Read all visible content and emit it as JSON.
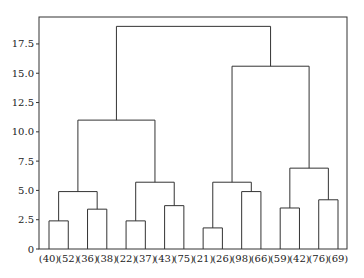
{
  "chart_data": {
    "type": "dendrogram",
    "title": "",
    "xlabel": "",
    "ylabel": "",
    "ylim": [
      0,
      19.8
    ],
    "yticks": [
      "0",
      "2.5",
      "5.0",
      "7.5",
      "10.0",
      "12.5",
      "15.0",
      "17.5"
    ],
    "grid": false,
    "leaves": [
      "(40)",
      "(52)",
      "(36)",
      "(38)",
      "(22)",
      "(37)",
      "(43)",
      "(75)",
      "(21)",
      "(26)",
      "(98)",
      "(66)",
      "(59)",
      "(42)",
      "(76)",
      "(69)"
    ],
    "merges": [
      {
        "left": "(40)",
        "right": "(52)",
        "height": 2.4
      },
      {
        "left": "(36)",
        "right": "(38)",
        "height": 3.4
      },
      {
        "left": "(22)",
        "right": "(37)",
        "height": 2.4
      },
      {
        "left": "(43)",
        "right": "(75)",
        "height": 3.7
      },
      {
        "left": "(21)",
        "right": "(26)",
        "height": 1.8
      },
      {
        "left": "(98)",
        "right": "(66)",
        "height": 4.9
      },
      {
        "left": "(59)",
        "right": "(42)",
        "height": 3.5
      },
      {
        "left": "(76)",
        "right": "(69)",
        "height": 4.2
      },
      {
        "left": "[(40),(52)]",
        "right": "[(36),(38)]",
        "height": 4.9
      },
      {
        "left": "[(22),(37)]",
        "right": "[(43),(75)]",
        "height": 5.7
      },
      {
        "left": "[(21),(26)]",
        "right": "[(98),(66)]",
        "height": 5.7
      },
      {
        "left": "[(59),(42)]",
        "right": "[(76),(69)]",
        "height": 6.9
      },
      {
        "left": "[(40)..(38)]",
        "right": "[(22)..(75)]",
        "height": 11.0
      },
      {
        "left": "[(21)..(66)]",
        "right": "[(59)..(69)]",
        "height": 15.6
      },
      {
        "left": "[(40)..(75)]",
        "right": "[(21)..(69)]",
        "height": 19.0
      }
    ]
  }
}
